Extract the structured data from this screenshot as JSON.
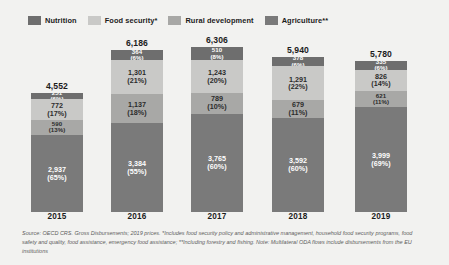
{
  "legend": {
    "items": [
      {
        "label": "Nutrition",
        "color": "#6e6e6e"
      },
      {
        "label": "Food security*",
        "color": "#c9c9c7"
      },
      {
        "label": "Rural development",
        "color": "#a8a8a6"
      },
      {
        "label": "Agriculture**",
        "color": "#7a7a7a"
      }
    ]
  },
  "footnote": {
    "text": "Source: OECD CRS. Gross Disbursements; 2019 prices. *Includes food security policy and administrative management, household food security programs, food safety and quality, food assistance, emergency food assistance; **Including forestry and fishing. Note: Multilateral ODA flows include disbursements from the EU institutions"
  },
  "chart_data": {
    "type": "bar",
    "subtype": "stacked-bar",
    "title": "",
    "xlabel": "",
    "ylabel": "",
    "grid": false,
    "legend_position": "top-left",
    "categories": [
      "2015",
      "2016",
      "2017",
      "2018",
      "2019"
    ],
    "totals": [
      "4,552",
      "6,186",
      "6,306",
      "5,940",
      "5,780"
    ],
    "totals_numeric": [
      4552,
      6186,
      6306,
      5940,
      5780
    ],
    "ylim": [
      0,
      6306
    ],
    "series": [
      {
        "name": "Nutrition",
        "color": "#6e6e6e",
        "text_on": "dark",
        "values": [
          251,
          364,
          510,
          378,
          335
        ],
        "labels": [
          "251",
          "364",
          "510",
          "378",
          "335"
        ],
        "percents": [
          "(6%)",
          "(6%)",
          "(8%)",
          "(6%)",
          "(6%)"
        ]
      },
      {
        "name": "Food security*",
        "color": "#c9c9c7",
        "text_on": "light",
        "values": [
          772,
          1301,
          1243,
          1291,
          826
        ],
        "labels": [
          "772",
          "1,301",
          "1,243",
          "1,291",
          "826"
        ],
        "percents": [
          "(17%)",
          "(21%)",
          "(20%)",
          "(22%)",
          "(14%)"
        ]
      },
      {
        "name": "Rural development",
        "color": "#a8a8a6",
        "text_on": "light",
        "values": [
          590,
          1137,
          789,
          679,
          621
        ],
        "labels": [
          "590",
          "1,137",
          "789",
          "679",
          "621"
        ],
        "percents": [
          "(13%)",
          "(18%)",
          "(10%)",
          "(11%)",
          "(11%)"
        ]
      },
      {
        "name": "Agriculture**",
        "color": "#7a7a7a",
        "text_on": "dark",
        "values": [
          2937,
          3384,
          3765,
          3592,
          3999
        ],
        "labels": [
          "2,937",
          "3,384",
          "3,765",
          "3,592",
          "3,999"
        ],
        "percents": [
          "(65%)",
          "(55%)",
          "(60%)",
          "(60%)",
          "(69%)"
        ]
      }
    ]
  }
}
